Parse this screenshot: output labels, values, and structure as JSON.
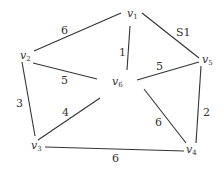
{
  "graph": {
    "vertices": [
      {
        "id": "v1",
        "name": "v",
        "sub": "1",
        "x": 131,
        "y": 12
      },
      {
        "id": "v2",
        "name": "v",
        "sub": "2",
        "x": 26,
        "y": 55
      },
      {
        "id": "v3",
        "name": "v",
        "sub": "3",
        "x": 36,
        "y": 145
      },
      {
        "id": "v4",
        "name": "v",
        "sub": "4",
        "x": 192,
        "y": 150
      },
      {
        "id": "v5",
        "name": "v",
        "sub": "5",
        "x": 208,
        "y": 60
      },
      {
        "id": "v6",
        "name": "v",
        "sub": "6",
        "x": 118,
        "y": 82
      }
    ],
    "edges": [
      {
        "from": "v1",
        "to": "v2",
        "weight": "6"
      },
      {
        "from": "v1",
        "to": "v6",
        "weight": "1"
      },
      {
        "from": "v1",
        "to": "v5",
        "weight": "S1"
      },
      {
        "from": "v2",
        "to": "v6",
        "weight": "5"
      },
      {
        "from": "v2",
        "to": "v3",
        "weight": "3"
      },
      {
        "from": "v6",
        "to": "v5",
        "weight": "5"
      },
      {
        "from": "v6",
        "to": "v3",
        "weight": "4"
      },
      {
        "from": "v6",
        "to": "v4",
        "weight": "6"
      },
      {
        "from": "v5",
        "to": "v4",
        "weight": "2"
      },
      {
        "from": "v3",
        "to": "v4",
        "weight": "6"
      }
    ]
  }
}
